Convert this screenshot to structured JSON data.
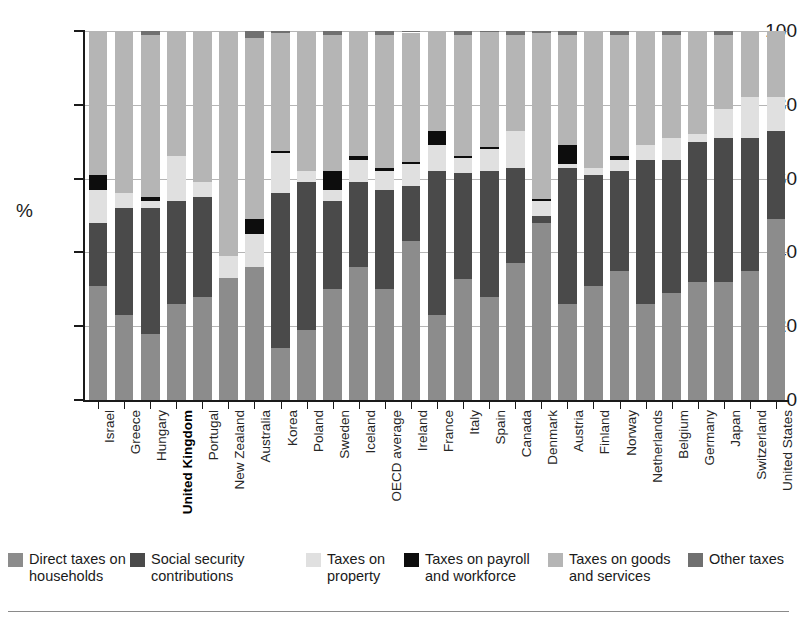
{
  "chart_data": {
    "type": "bar",
    "stacked": true,
    "normalized": true,
    "title": "",
    "subtitle": "",
    "xlabel": "",
    "ylabel": "%",
    "ylim": [
      0,
      100
    ],
    "yticks": [
      0,
      20,
      40,
      60,
      80,
      100
    ],
    "grid": true,
    "legend_position": "bottom",
    "highlight_category": "United Kingdom",
    "categories": [
      "Israel",
      "Greece",
      "Hungary",
      "United Kingdom",
      "Portugal",
      "New Zealand",
      "Australia",
      "Korea",
      "Poland",
      "Sweden",
      "Iceland",
      "OECD average",
      "Ireland",
      "France",
      "Italy",
      "Spain",
      "Canada",
      "Denmark",
      "Austria",
      "Finland",
      "Norway",
      "Netherlands",
      "Belgium",
      "Germany",
      "Japan",
      "Switzerland",
      "United States"
    ],
    "series": [
      {
        "name": "Direct taxes on households",
        "color": "#8c8c8c",
        "values": [
          31,
          23,
          18,
          26,
          28,
          33,
          36,
          14,
          19,
          30,
          36,
          30,
          43,
          23,
          33,
          28,
          37,
          48,
          26,
          31,
          35,
          26,
          29,
          32,
          32,
          35,
          49
        ]
      },
      {
        "name": "Social security contributions",
        "color": "#4a4a4a",
        "values": [
          17,
          29,
          34,
          28,
          27,
          0,
          0,
          42,
          40,
          24,
          23,
          27,
          15,
          39,
          29,
          34,
          26,
          2,
          37,
          30,
          27,
          39,
          36,
          38,
          39,
          36,
          24
        ]
      },
      {
        "name": "Taxes on property",
        "color": "#e0e0e0",
        "values": [
          9,
          4,
          2,
          12,
          4,
          6,
          9,
          11,
          3,
          3,
          6,
          5,
          6,
          7,
          4,
          6,
          10,
          4,
          1,
          2,
          3,
          4,
          6,
          2,
          8,
          11,
          9
        ]
      },
      {
        "name": "Taxes on payroll and workforce",
        "color": "#0d0d0d",
        "values": [
          4,
          0,
          1,
          0,
          0,
          0,
          4,
          0.5,
          0,
          5,
          1,
          1,
          0.6,
          4,
          0.7,
          0.7,
          0,
          0.5,
          5,
          0,
          1,
          0,
          0,
          0,
          0,
          0,
          0
        ]
      },
      {
        "name": "Taxes on goods and services",
        "color": "#b5b5b5",
        "values": [
          39,
          44,
          44,
          34,
          41,
          61,
          49,
          32,
          38,
          37,
          34,
          36,
          35,
          27,
          33,
          31,
          26,
          45,
          30,
          37,
          33,
          31,
          28,
          28,
          20,
          18,
          18
        ]
      },
      {
        "name": "Other taxes",
        "color": "#707070",
        "values": [
          0,
          0,
          1,
          0,
          0,
          0,
          2,
          0.5,
          0,
          1,
          0,
          1,
          0.4,
          0,
          1,
          0.3,
          1,
          0.5,
          1,
          0,
          1,
          0,
          1,
          0,
          1,
          0,
          0
        ]
      }
    ],
    "legend_entries": [
      {
        "label": "Direct taxes on\nhouseholds",
        "color": "#8c8c8c"
      },
      {
        "label": "Social security\ncontributions",
        "color": "#4a4a4a"
      },
      {
        "label": "Taxes on\nproperty",
        "color": "#e0e0e0"
      },
      {
        "label": "Taxes on payroll\nand workforce",
        "color": "#0d0d0d"
      },
      {
        "label": "Taxes on goods\nand services",
        "color": "#b5b5b5"
      },
      {
        "label": "Other taxes",
        "color": "#707070"
      }
    ]
  }
}
